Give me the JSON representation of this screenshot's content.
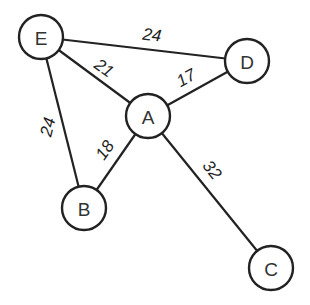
{
  "graph": {
    "type": "weighted-undirected-graph",
    "colors": {
      "stroke": "#222222",
      "node_fill": "#ffffff",
      "text": "#333333",
      "background": "#ffffff"
    },
    "nodes": [
      {
        "id": "E",
        "label": "E"
      },
      {
        "id": "D",
        "label": "D"
      },
      {
        "id": "A",
        "label": "A"
      },
      {
        "id": "B",
        "label": "B"
      },
      {
        "id": "C",
        "label": "C"
      }
    ],
    "edges": [
      {
        "from": "E",
        "to": "D",
        "weight": "24"
      },
      {
        "from": "E",
        "to": "A",
        "weight": "21"
      },
      {
        "from": "A",
        "to": "D",
        "weight": "17"
      },
      {
        "from": "E",
        "to": "B",
        "weight": "24"
      },
      {
        "from": "B",
        "to": "A",
        "weight": "18"
      },
      {
        "from": "A",
        "to": "C",
        "weight": "32"
      }
    ]
  }
}
